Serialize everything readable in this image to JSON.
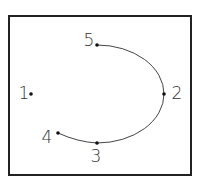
{
  "diagram": {
    "frame": {
      "x": 9,
      "y": 16,
      "width": 182,
      "height": 159,
      "stroke": "#222222"
    },
    "curve": {
      "stroke": "#444444",
      "path": "M 58 133 Q 78 142 97 143 A 67 49 0 0 0 164 94 A 67 49 0 0 0 97 45",
      "passes_through": [
        "4",
        "3",
        "2",
        "5"
      ]
    },
    "points": [
      {
        "id": "1",
        "label": "1",
        "x": 31,
        "y": 94,
        "label_x": 24,
        "label_y": 99,
        "label_anchor": "middle"
      },
      {
        "id": "2",
        "label": "2",
        "x": 164,
        "y": 94,
        "label_x": 177,
        "label_y": 99,
        "label_anchor": "middle"
      },
      {
        "id": "3",
        "label": "3",
        "x": 97,
        "y": 143,
        "label_x": 96,
        "label_y": 162,
        "label_anchor": "middle"
      },
      {
        "id": "4",
        "label": "4",
        "x": 58,
        "y": 133,
        "label_x": 47,
        "label_y": 143,
        "label_anchor": "middle"
      },
      {
        "id": "5",
        "label": "5",
        "x": 97,
        "y": 45,
        "label_x": 89,
        "label_y": 46,
        "label_anchor": "middle"
      }
    ]
  }
}
